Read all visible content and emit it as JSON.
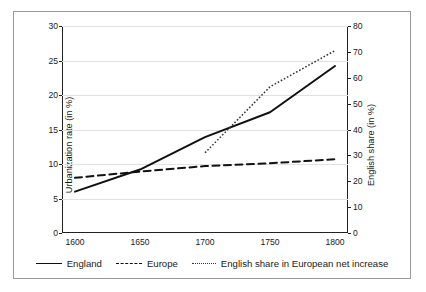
{
  "chart_data": {
    "type": "line",
    "title": "",
    "xlabel": "",
    "ylabel": "Urbanization rate (in %)",
    "y2label": "English share (in %)",
    "x": [
      1600,
      1650,
      1700,
      1750,
      1800
    ],
    "xlim": [
      1590,
      1810
    ],
    "ylim": [
      0,
      30
    ],
    "y2lim": [
      0,
      80
    ],
    "xticks": [
      "1600",
      "1650",
      "1700",
      "1750",
      "1800"
    ],
    "yticks": [
      "0",
      "5",
      "10",
      "15",
      "20",
      "25",
      "30"
    ],
    "y2ticks": [
      "0",
      "10",
      "20",
      "30",
      "40",
      "50",
      "60",
      "70",
      "80"
    ],
    "grid": true,
    "legend_position": "bottom",
    "series": [
      {
        "name": "England",
        "axis": "left",
        "style": "solid",
        "color": "#111111",
        "x": [
          1600,
          1650,
          1700,
          1750,
          1800
        ],
        "values": [
          6.0,
          9.2,
          13.9,
          17.5,
          24.2
        ]
      },
      {
        "name": "Europe",
        "axis": "left",
        "style": "dashed",
        "color": "#111111",
        "x": [
          1600,
          1650,
          1700,
          1750,
          1800
        ],
        "values": [
          8.0,
          8.9,
          9.7,
          10.1,
          10.7
        ]
      },
      {
        "name": "English share in European net increase",
        "axis": "right",
        "style": "dotted",
        "color": "#333333",
        "x": [
          1700,
          1750,
          1800
        ],
        "values": [
          31.0,
          56.5,
          70.5
        ]
      }
    ]
  },
  "legend": {
    "items": [
      {
        "label": "England"
      },
      {
        "label": "Europe"
      },
      {
        "label": "English share in European net increase"
      }
    ]
  },
  "axes": {
    "left_title": "Urbanization rate (in %)",
    "right_title": "English share (in %)"
  }
}
